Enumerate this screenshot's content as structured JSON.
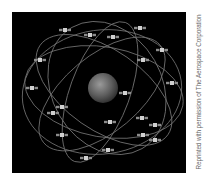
{
  "figure": {
    "background_color": "#000000",
    "orbit_color": "#8a8a8a",
    "satellite_color": "#bdbdbd",
    "globe": {
      "cx": 91,
      "cy": 76,
      "r": 15
    },
    "satellites": [
      [
        53,
        18
      ],
      [
        78,
        23
      ],
      [
        101,
        25
      ],
      [
        128,
        16
      ],
      [
        150,
        38
      ],
      [
        131,
        48
      ],
      [
        28,
        48
      ],
      [
        20,
        76
      ],
      [
        160,
        71
      ],
      [
        41,
        101
      ],
      [
        50,
        95
      ],
      [
        50,
        123
      ],
      [
        98,
        110
      ],
      [
        130,
        106
      ],
      [
        143,
        113
      ],
      [
        131,
        123
      ],
      [
        143,
        128
      ],
      [
        96,
        138
      ],
      [
        74,
        146
      ],
      [
        113,
        81
      ]
    ]
  },
  "credit": {
    "text": "Reprinted with permission of The Aerospace Corporation"
  }
}
